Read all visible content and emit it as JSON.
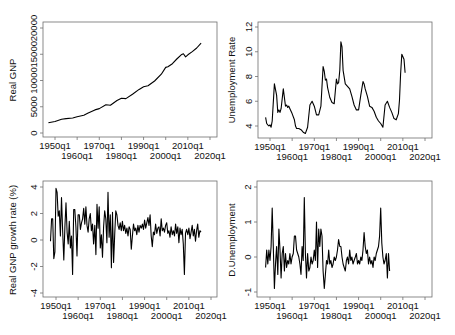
{
  "chart_data": [
    {
      "type": "line",
      "panel": "top-left",
      "title": "",
      "xlabel": "",
      "ylabel": "Real GNP",
      "xticks": [
        "1950q1",
        "1960q1",
        "1970q1",
        "1980q1",
        "1990q1",
        "2000q1",
        "2010q1",
        "2020q1"
      ],
      "yticks": [
        "0",
        "5000",
        "10000",
        "15000",
        "20000"
      ],
      "ylim": [
        0,
        20000
      ],
      "xlim": [
        1945,
        2022
      ],
      "grid": false,
      "x": [
        1947,
        1950,
        1953,
        1955,
        1958,
        1960,
        1963,
        1965,
        1968,
        1970,
        1973,
        1975,
        1978,
        1980,
        1982,
        1985,
        1988,
        1990,
        1992,
        1995,
        1998,
        2000,
        2001,
        2003,
        2005,
        2007,
        2008,
        2009,
        2010,
        2012,
        2014,
        2016
      ],
      "values": [
        1950,
        2200,
        2600,
        2750,
        2850,
        3100,
        3400,
        3800,
        4400,
        4650,
        5400,
        5300,
        6200,
        6600,
        6550,
        7400,
        8300,
        8800,
        9000,
        9900,
        11200,
        12500,
        12600,
        13200,
        14100,
        14900,
        15100,
        14500,
        14900,
        15500,
        16200,
        17100
      ]
    },
    {
      "type": "line",
      "panel": "top-right",
      "title": "",
      "xlabel": "",
      "ylabel": "Unemployment Rate",
      "xticks": [
        "1950q1",
        "1960q1",
        "1970q1",
        "1980q1",
        "1990q1",
        "2000q1",
        "2010q1",
        "2020q1"
      ],
      "yticks": [
        "4",
        "6",
        "8",
        "10",
        "12"
      ],
      "ylim": [
        3,
        12.5
      ],
      "xlim": [
        1945,
        2022
      ],
      "grid": false,
      "x": [
        1948,
        1948.5,
        1949,
        1949.5,
        1950,
        1950.5,
        1951,
        1952,
        1953,
        1953.5,
        1954,
        1954.5,
        1955,
        1956,
        1957,
        1957.5,
        1958,
        1958.5,
        1959,
        1960,
        1961,
        1961.5,
        1962,
        1963,
        1964,
        1965,
        1966,
        1967,
        1968,
        1969,
        1970,
        1971,
        1972,
        1973,
        1974,
        1974.5,
        1975,
        1975.5,
        1976,
        1977,
        1978,
        1979,
        1980,
        1980.5,
        1981,
        1981.5,
        1982,
        1982.5,
        1983,
        1984,
        1985,
        1986,
        1987,
        1988,
        1989,
        1990,
        1991,
        1992,
        1992.5,
        1993,
        1994,
        1995,
        1996,
        1997,
        1998,
        1999,
        2000,
        2001,
        2002,
        2003,
        2004,
        2005,
        2006,
        2007,
        2008,
        2008.5,
        2009,
        2009.5,
        2010,
        2010.5,
        2011
      ],
      "values": [
        4.7,
        4.2,
        4.1,
        4.0,
        4.1,
        3.9,
        4.4,
        7.4,
        6.5,
        5.1,
        5.3,
        5.1,
        5.4,
        7.0,
        5.6,
        5.7,
        5.5,
        5.6,
        5.4,
        5.0,
        4.5,
        4.0,
        3.8,
        3.8,
        3.7,
        3.5,
        3.4,
        3.9,
        5.7,
        6.0,
        5.6,
        4.9,
        4.9,
        5.6,
        8.8,
        8.4,
        7.7,
        7.8,
        7.1,
        6.3,
        5.9,
        5.8,
        7.8,
        7.4,
        7.5,
        8.5,
        10.8,
        10.4,
        8.5,
        7.4,
        7.2,
        7.0,
        6.4,
        5.7,
        5.3,
        5.3,
        6.5,
        7.6,
        7.4,
        7.0,
        6.4,
        5.6,
        5.5,
        5.2,
        4.7,
        4.4,
        4.2,
        3.9,
        5.7,
        6.0,
        5.5,
        5.1,
        4.6,
        4.5,
        5.0,
        6.1,
        8.2,
        9.8,
        9.6,
        9.4,
        8.3
      ]
    },
    {
      "type": "line",
      "panel": "bottom-left",
      "title": "",
      "xlabel": "",
      "ylabel": "Real GNP growth rate (%)",
      "xticks": [
        "1950q1",
        "1960q1",
        "1970q1",
        "1980q1",
        "1990q1",
        "2000q1",
        "2010q1",
        "2020q1"
      ],
      "yticks": [
        "-4",
        "-2",
        "0",
        "2",
        "4"
      ],
      "ylim": [
        -4.3,
        4.3
      ],
      "xlim": [
        1945,
        2022
      ],
      "grid": false,
      "x": [
        1947.5,
        1948,
        1948.5,
        1949,
        1949.5,
        1950,
        1950.5,
        1951,
        1951.5,
        1952,
        1952.5,
        1953,
        1953.5,
        1954,
        1954.5,
        1955,
        1955.5,
        1956,
        1956.5,
        1957,
        1957.5,
        1958,
        1958.5,
        1959,
        1959.5,
        1960,
        1960.5,
        1961,
        1961.5,
        1962,
        1962.5,
        1963,
        1963.5,
        1964,
        1964.5,
        1965,
        1965.5,
        1966,
        1966.5,
        1967,
        1967.5,
        1968,
        1968.5,
        1969,
        1969.5,
        1970,
        1970.5,
        1971,
        1971.5,
        1972,
        1972.5,
        1973,
        1973.5,
        1974,
        1974.5,
        1975,
        1975.5,
        1976,
        1976.5,
        1977,
        1977.5,
        1978,
        1978.5,
        1979,
        1979.5,
        1980,
        1980.5,
        1981,
        1981.5,
        1982,
        1982.5,
        1983,
        1983.5,
        1984,
        1984.5,
        1985,
        1985.5,
        1986,
        1986.5,
        1987,
        1987.5,
        1988,
        1988.5,
        1989,
        1989.5,
        1990,
        1990.5,
        1991,
        1991.5,
        1992,
        1992.5,
        1993,
        1993.5,
        1994,
        1994.5,
        1995,
        1995.5,
        1996,
        1996.5,
        1997,
        1997.5,
        1998,
        1998.5,
        1999,
        1999.5,
        2000,
        2000.5,
        2001,
        2001.5,
        2002,
        2002.5,
        2003,
        2003.5,
        2004,
        2004.5,
        2005,
        2005.5,
        2006,
        2006.5,
        2007,
        2007.5,
        2008,
        2008.5,
        2009,
        2009.5,
        2010,
        2010.5,
        2011,
        2011.5,
        2012,
        2012.5,
        2013,
        2013.5,
        2014,
        2014.5,
        2015,
        2015.5
      ],
      "values": [
        -0.1,
        1.6,
        1.6,
        -1.4,
        -0.9,
        3.9,
        3.6,
        1.8,
        2.2,
        0.3,
        3.2,
        0.8,
        -1.5,
        1.0,
        2.8,
        0.6,
        -0.3,
        1.4,
        -0.6,
        0.3,
        -2.6,
        2.3,
        2.3,
        1.0,
        -1.2,
        1.9,
        1.9,
        0.8,
        1.3,
        1.6,
        2.4,
        1.2,
        2.5,
        1.1,
        0.6,
        1.6,
        2.0,
        0.7,
        1.2,
        -0.3,
        1.1,
        -1.1,
        2.7,
        0.9,
        2.5,
        -0.6,
        0.4,
        -1.3,
        1.0,
        2.2,
        1.6,
        -0.2,
        3.6,
        0.2,
        1.9,
        -2.1,
        2.1,
        -1.7,
        0.4,
        2.2,
        1.9,
        1.1,
        0.8,
        1.3,
        0.7,
        1.4,
        0.7,
        1.1,
        0.5,
        0.9,
        0.3,
        1.0,
        0.8,
        -0.7,
        0.3,
        1.2,
        0.7,
        0.9,
        0.4,
        1.1,
        0.6,
        1.1,
        0.9,
        1.2,
        0.8,
        1.5,
        0.9,
        1.3,
        1.7,
        1.1,
        1.9,
        0.3,
        -0.5,
        0.6,
        0.4,
        1.2,
        0.5,
        0.9,
        1.0,
        0.3,
        1.6,
        0.7,
        0.9,
        0.6,
        1.1,
        1.3,
        0.5,
        0.7,
        0.2,
        1.0,
        0.4,
        0.7,
        0.3,
        1.2,
        0.5,
        1.0,
        -0.2,
        0.9,
        0.4,
        0.8,
        -0.3,
        -2.6,
        0.5,
        0.8,
        0.4,
        0.9,
        0.1,
        0.6,
        1.1,
        0.3,
        0.8,
        -0.1,
        0.7,
        1.2,
        0.2,
        0.7,
        0.6
      ]
    },
    {
      "type": "line",
      "panel": "bottom-right",
      "title": "",
      "xlabel": "",
      "ylabel": "D.Unemployment",
      "xticks": [
        "1950q1",
        "1960q1",
        "1970q1",
        "1980q1",
        "1990q1",
        "2000q1",
        "2010q1",
        "2020q1"
      ],
      "yticks": [
        "-1",
        "0",
        "1",
        "2"
      ],
      "ylim": [
        -1.15,
        2.15
      ],
      "xlim": [
        1945,
        2022
      ],
      "grid": false,
      "x": [
        1948,
        1948.5,
        1949,
        1949.5,
        1950,
        1950.5,
        1951,
        1951.5,
        1952,
        1952.5,
        1953,
        1953.5,
        1954,
        1954.5,
        1955,
        1955.5,
        1956,
        1956.5,
        1957,
        1957.5,
        1958,
        1958.5,
        1959,
        1959.5,
        1960,
        1960.5,
        1961,
        1961.5,
        1962,
        1962.5,
        1963,
        1963.5,
        1964,
        1964.5,
        1965,
        1965.5,
        1966,
        1966.5,
        1967,
        1967.5,
        1968,
        1968.5,
        1969,
        1969.5,
        1970,
        1970.5,
        1971,
        1971.5,
        1972,
        1972.5,
        1973,
        1973.5,
        1974,
        1974.5,
        1975,
        1975.5,
        1976,
        1976.5,
        1977,
        1977.5,
        1978,
        1978.5,
        1979,
        1979.5,
        1980,
        1980.5,
        1981,
        1981.5,
        1982,
        1982.5,
        1983,
        1983.5,
        1984,
        1984.5,
        1985,
        1985.5,
        1986,
        1986.5,
        1987,
        1987.5,
        1988,
        1988.5,
        1989,
        1989.5,
        1990,
        1990.5,
        1991,
        1991.5,
        1992,
        1992.5,
        1993,
        1993.5,
        1994,
        1994.5,
        1995,
        1995.5,
        1996,
        1996.5,
        1997,
        1997.5,
        1998,
        1998.5,
        1999,
        1999.5,
        2000,
        2000.5,
        2001,
        2001.5,
        2002,
        2002.5,
        2003,
        2003.5,
        2004,
        2004.5,
        2005,
        2005.5,
        2006,
        2006.5,
        2007,
        2007.5,
        2008,
        2008.5,
        2009,
        2009.5,
        2010,
        2010.5,
        2011
      ],
      "values": [
        -0.3,
        0.2,
        -0.2,
        0.2,
        -0.1,
        0.3,
        1.4,
        0.3,
        -0.9,
        -0.2,
        0.3,
        -0.5,
        0.8,
        0.2,
        -0.6,
        0.1,
        0.3,
        -0.4,
        0.1,
        -0.3,
        -0.1,
        -0.2,
        0.1,
        -0.2,
        0.0,
        0.1,
        0.6,
        0.6,
        0.2,
        0.1,
        0.0,
        -0.2,
        -0.5,
        0.3,
        -0.1,
        1.7,
        0.1,
        -0.6,
        0.1,
        -0.4,
        -0.3,
        0.0,
        -0.2,
        -0.1,
        0.2,
        -0.1,
        1.0,
        -0.3,
        0.8,
        0.3,
        0.8,
        0.6,
        -0.4,
        -0.9,
        -0.5,
        -0.1,
        -0.2,
        0.2,
        -0.2,
        -0.1,
        -0.3,
        -0.2,
        0.0,
        -0.1,
        0.0,
        0.2,
        0.5,
        0.3,
        0.3,
        0.0,
        -0.2,
        -0.3,
        -0.4,
        -0.1,
        0.0,
        -0.2,
        0.2,
        -0.1,
        0.0,
        -0.2,
        -0.1,
        0.0,
        0.1,
        -0.2,
        -0.1,
        -0.2,
        0.0,
        -0.1,
        0.2,
        0.7,
        0.3,
        0.1,
        0.2,
        -0.2,
        0.0,
        -0.2,
        -0.1,
        -0.3,
        0.0,
        -0.1,
        0.1,
        0.2,
        0.3,
        0.6,
        1.4,
        0.4,
        0.0,
        -0.2,
        -0.1,
        0.1,
        -0.6,
        0.1,
        -0.4
      ]
    }
  ],
  "labels": {
    "tl_ylabel": "Real GNP",
    "tr_ylabel": "Unemployment Rate",
    "bl_ylabel": "Real GNP growth rate (%)",
    "br_ylabel": "D.Unemployment"
  }
}
